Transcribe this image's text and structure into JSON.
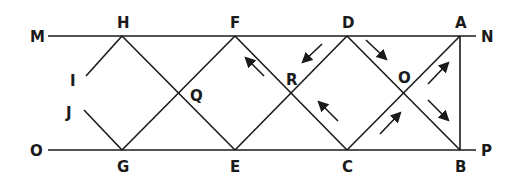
{
  "diagram": {
    "type": "geometric-reflection-figure",
    "colors": {
      "stroke": "#1a1a1a",
      "background": "#ffffff"
    },
    "lines": {
      "top": {
        "from": "M",
        "to": "N"
      },
      "bottom": {
        "from": "O",
        "to": "P"
      }
    },
    "labels": {
      "M": "M",
      "N": "N",
      "O": "O",
      "P": "P",
      "H": "H",
      "F": "F",
      "D": "D",
      "A": "A",
      "G": "G",
      "E": "E",
      "C": "C",
      "B": "B",
      "I": "I",
      "J": "J",
      "Q": "Q",
      "R": "R",
      "Ocenter": "O"
    },
    "points": {
      "M": [
        48,
        36
      ],
      "N": [
        476,
        36
      ],
      "O": [
        48,
        150
      ],
      "P": [
        476,
        150
      ],
      "H": [
        122,
        36
      ],
      "F": [
        235,
        36
      ],
      "D": [
        347,
        36
      ],
      "A": [
        460,
        36
      ],
      "G": [
        122,
        150
      ],
      "E": [
        235,
        150
      ],
      "C": [
        347,
        150
      ],
      "B": [
        460,
        150
      ],
      "I": [
        86,
        76
      ],
      "J": [
        84,
        110
      ],
      "Q": [
        178,
        93
      ],
      "R": [
        291,
        93
      ],
      "Ocenter": [
        404,
        93
      ]
    },
    "segments": [
      [
        "I",
        "H"
      ],
      [
        "H",
        "E"
      ],
      [
        "J",
        "G"
      ],
      [
        "G",
        "F"
      ],
      [
        "F",
        "C"
      ],
      [
        "E",
        "D"
      ],
      [
        "D",
        "B"
      ],
      [
        "C",
        "A"
      ],
      [
        "A",
        "B"
      ]
    ],
    "arrows": [
      {
        "near": "F-R",
        "direction": "up-left"
      },
      {
        "near": "R-D",
        "direction": "down-left"
      },
      {
        "near": "D-O",
        "direction": "down-right"
      },
      {
        "near": "C-R",
        "direction": "up-left"
      },
      {
        "near": "C-O",
        "direction": "up-right"
      },
      {
        "near": "O-A",
        "direction": "up-right"
      },
      {
        "near": "O-B",
        "direction": "down-right"
      }
    ]
  }
}
